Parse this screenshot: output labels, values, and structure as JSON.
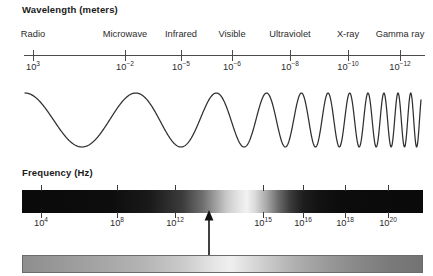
{
  "wavelength": {
    "heading": "Wavelength (meters)",
    "bands": [
      {
        "label": "Radio",
        "x": 33
      },
      {
        "label": "Microwave",
        "x": 125
      },
      {
        "label": "Infrared",
        "x": 181
      },
      {
        "label": "Visible",
        "x": 232
      },
      {
        "label": "Ultraviolet",
        "x": 290
      },
      {
        "label": "X-ray",
        "x": 348
      },
      {
        "label": "Gamma ray",
        "x": 400
      }
    ],
    "ticks": [
      {
        "base": "10",
        "exp": "3",
        "x": 33
      },
      {
        "base": "10",
        "exp": "−2",
        "x": 125
      },
      {
        "base": "10",
        "exp": "−5",
        "x": 181
      },
      {
        "base": "10",
        "exp": "−6",
        "x": 232
      },
      {
        "base": "10",
        "exp": "−8",
        "x": 290
      },
      {
        "base": "10",
        "exp": "−10",
        "x": 348
      },
      {
        "base": "10",
        "exp": "−12",
        "x": 400
      }
    ]
  },
  "frequency": {
    "heading": "Frequency (Hz)",
    "ticks": [
      {
        "base": "10",
        "exp": "4",
        "x": 41
      },
      {
        "base": "10",
        "exp": "8",
        "x": 117
      },
      {
        "base": "10",
        "exp": "12",
        "x": 175
      },
      {
        "base": "10",
        "exp": "15",
        "x": 263
      },
      {
        "base": "10",
        "exp": "16",
        "x": 303
      },
      {
        "base": "10",
        "exp": "18",
        "x": 345
      },
      {
        "base": "10",
        "exp": "20",
        "x": 388
      }
    ]
  },
  "pointer": {
    "name": "visible-light-indicator",
    "x": 209
  },
  "chart_data": {
    "type": "line",
    "xlabel": "Wavelength (meters) / Frequency (Hz)",
    "ylabel": "",
    "grid": false,
    "legend_position": "none",
    "wavelength_axis": {
      "label": "Wavelength (meters)",
      "tick_values": [
        1000.0,
        0.01,
        1e-05,
        1e-06,
        1e-08,
        1e-10,
        1e-12
      ],
      "tick_labels": [
        "10^3",
        "10^-2",
        "10^-5",
        "10^-6",
        "10^-8",
        "10^-10",
        "10^-12"
      ],
      "band_names": [
        "Radio",
        "Microwave",
        "Infrared",
        "Visible",
        "Ultraviolet",
        "X-ray",
        "Gamma ray"
      ]
    },
    "frequency_axis": {
      "label": "Frequency (Hz)",
      "tick_values": [
        10000.0,
        100000000.0,
        1000000000000.0,
        1000000000000000.0,
        1e+16,
        1e+18,
        1e+20
      ],
      "tick_labels": [
        "10^4",
        "10^8",
        "10^12",
        "10^15",
        "10^16",
        "10^18",
        "10^20"
      ]
    },
    "waveform": {
      "description": "Sinusoid whose frequency increases continuously from left (long wavelength) to right (short wavelength)",
      "amplitude_constant": true
    },
    "annotations": [
      {
        "text": "arrow marking visible light region",
        "x_frequency": "~10^14",
        "points_to": "frequency bar"
      }
    ]
  },
  "colors": {
    "axis": "#4a4a4a",
    "text": "#2b2b2b",
    "heading": "#1a1a1a",
    "wave_stroke": "#2f2f2f",
    "spectrum_dark": "#0a0a0a",
    "spectrum_light": "#f2f2f2",
    "visible_bar_border": "#6b6b6b"
  }
}
